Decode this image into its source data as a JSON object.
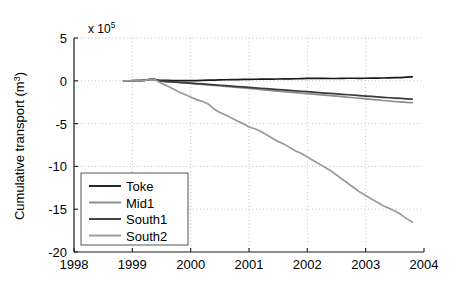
{
  "chart_data": {
    "type": "line",
    "title": "",
    "xlabel": "",
    "ylabel": "Cumulative transport (m3)",
    "ylabel_display": "Cumulative transport (m",
    "ylabel_sup": "3",
    "ylabel_tail": ")",
    "y_multiplier_text": "x 10",
    "y_multiplier_exp": "5",
    "xlim": [
      1998,
      2004
    ],
    "ylim": [
      -20,
      5
    ],
    "xticks": [
      1998,
      1999,
      2000,
      2001,
      2002,
      2003,
      2004
    ],
    "xtick_labels": [
      "1998",
      "1999",
      "2000",
      "2001",
      "2002",
      "2003",
      "2004"
    ],
    "yticks": [
      5,
      0,
      -5,
      -10,
      -15,
      -20
    ],
    "ytick_labels": [
      "5",
      "0",
      "-5",
      "-10",
      "-15",
      "-20"
    ],
    "grid": true,
    "grid_style": "dotted",
    "legend_position": "lower-left",
    "legend_entries": [
      "Toke",
      "Mid1",
      "South1",
      "South2"
    ],
    "colors": {
      "Toke": "#1a1a1a",
      "Mid1": "#8c8c8c",
      "South1": "#3a3a3a",
      "South2": "#9a9a9a",
      "axis": "#1a1a1a",
      "grid": "#b9b9b9",
      "background": "#ffffff"
    },
    "x": [
      1998.85,
      1998.95,
      1999.05,
      1999.15,
      1999.25,
      1999.3,
      1999.35,
      1999.4,
      1999.45,
      1999.5,
      1999.6,
      1999.7,
      1999.8,
      1999.9,
      2000.0,
      2000.1,
      2000.2,
      2000.3,
      2000.4,
      2000.5,
      2000.6,
      2000.7,
      2000.8,
      2000.9,
      2001.0,
      2001.1,
      2001.2,
      2001.3,
      2001.4,
      2001.5,
      2001.6,
      2001.7,
      2001.8,
      2001.9,
      2002.0,
      2002.1,
      2002.2,
      2002.3,
      2002.4,
      2002.5,
      2002.6,
      2002.7,
      2002.8,
      2002.9,
      2003.0,
      2003.1,
      2003.2,
      2003.3,
      2003.4,
      2003.5,
      2003.6,
      2003.7,
      2003.8
    ],
    "series": [
      {
        "name": "Toke",
        "color": "#1a1a1a",
        "values": [
          0.0,
          0.0,
          0.02,
          0.05,
          0.1,
          0.18,
          0.2,
          0.15,
          0.08,
          0.05,
          0.04,
          0.03,
          0.02,
          0.02,
          0.02,
          0.03,
          0.05,
          0.07,
          0.08,
          0.1,
          0.12,
          0.13,
          0.14,
          0.16,
          0.17,
          0.18,
          0.19,
          0.2,
          0.2,
          0.21,
          0.22,
          0.23,
          0.24,
          0.26,
          0.28,
          0.3,
          0.29,
          0.28,
          0.27,
          0.27,
          0.28,
          0.3,
          0.3,
          0.29,
          0.3,
          0.31,
          0.32,
          0.33,
          0.34,
          0.36,
          0.38,
          0.42,
          0.46
        ]
      },
      {
        "name": "Mid1",
        "color": "#8c8c8c",
        "values": [
          0.0,
          0.0,
          0.01,
          0.03,
          0.07,
          0.14,
          0.16,
          0.1,
          0.0,
          -0.05,
          -0.1,
          -0.15,
          -0.2,
          -0.25,
          -0.3,
          -0.36,
          -0.42,
          -0.48,
          -0.54,
          -0.6,
          -0.66,
          -0.72,
          -0.78,
          -0.84,
          -0.9,
          -0.96,
          -1.02,
          -1.08,
          -1.14,
          -1.2,
          -1.26,
          -1.32,
          -1.38,
          -1.44,
          -1.5,
          -1.56,
          -1.62,
          -1.68,
          -1.74,
          -1.8,
          -1.86,
          -1.92,
          -1.98,
          -2.04,
          -2.1,
          -2.16,
          -2.22,
          -2.3,
          -2.36,
          -2.42,
          -2.47,
          -2.52,
          -2.55
        ]
      },
      {
        "name": "South1",
        "color": "#3a3a3a",
        "values": [
          0.0,
          0.0,
          0.01,
          0.03,
          0.07,
          0.15,
          0.17,
          0.11,
          0.01,
          -0.04,
          -0.09,
          -0.13,
          -0.18,
          -0.22,
          -0.27,
          -0.32,
          -0.37,
          -0.42,
          -0.47,
          -0.52,
          -0.57,
          -0.62,
          -0.67,
          -0.72,
          -0.77,
          -0.82,
          -0.87,
          -0.92,
          -0.97,
          -1.02,
          -1.07,
          -1.12,
          -1.17,
          -1.22,
          -1.27,
          -1.32,
          -1.38,
          -1.43,
          -1.48,
          -1.53,
          -1.58,
          -1.63,
          -1.68,
          -1.73,
          -1.78,
          -1.83,
          -1.88,
          -1.93,
          -1.98,
          -2.02,
          -2.06,
          -2.1,
          -2.13
        ]
      },
      {
        "name": "South2",
        "color": "#9a9a9a",
        "values": [
          0.0,
          0.0,
          0.01,
          0.03,
          0.07,
          0.15,
          0.16,
          0.08,
          -0.1,
          -0.3,
          -0.6,
          -0.95,
          -1.3,
          -1.6,
          -1.9,
          -2.2,
          -2.4,
          -2.7,
          -3.3,
          -3.7,
          -4.0,
          -4.35,
          -4.7,
          -5.0,
          -5.4,
          -5.6,
          -5.9,
          -6.3,
          -6.7,
          -7.1,
          -7.4,
          -7.8,
          -8.2,
          -8.5,
          -8.9,
          -9.3,
          -9.7,
          -10.1,
          -10.5,
          -11.0,
          -11.5,
          -12.0,
          -12.5,
          -13.0,
          -13.4,
          -13.8,
          -14.2,
          -14.6,
          -14.9,
          -15.2,
          -15.6,
          -16.1,
          -16.5
        ]
      }
    ]
  }
}
